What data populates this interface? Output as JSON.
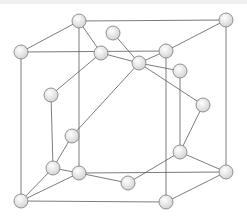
{
  "diagram": {
    "type": "crystal-lattice",
    "colors": {
      "bond": "#5a5a5a",
      "atom_fill_light": "#ffffff",
      "atom_fill_dark": "#d4d4d4",
      "atom_stroke": "#7a7a7a",
      "background": "#ffffff"
    },
    "atom_radius": 7,
    "atoms": [
      {
        "id": "A",
        "x": 79,
        "y": 21
      },
      {
        "id": "B",
        "x": 226,
        "y": 20
      },
      {
        "id": "C",
        "x": 21,
        "y": 52
      },
      {
        "id": "D",
        "x": 166,
        "y": 51
      },
      {
        "id": "E",
        "x": 113,
        "y": 33
      },
      {
        "id": "F",
        "x": 101,
        "y": 53
      },
      {
        "id": "G",
        "x": 139,
        "y": 63
      },
      {
        "id": "H",
        "x": 180,
        "y": 71
      },
      {
        "id": "I",
        "x": 203,
        "y": 105
      },
      {
        "id": "J",
        "x": 51,
        "y": 95
      },
      {
        "id": "K",
        "x": 72,
        "y": 136
      },
      {
        "id": "L",
        "x": 53,
        "y": 168
      },
      {
        "id": "M",
        "x": 79,
        "y": 173
      },
      {
        "id": "N",
        "x": 128,
        "y": 183
      },
      {
        "id": "O",
        "x": 180,
        "y": 152
      },
      {
        "id": "P",
        "x": 226,
        "y": 172
      },
      {
        "id": "Q",
        "x": 21,
        "y": 201
      },
      {
        "id": "R",
        "x": 166,
        "y": 202
      }
    ],
    "bonds": [
      [
        "A",
        "B"
      ],
      [
        "A",
        "C"
      ],
      [
        "C",
        "D"
      ],
      [
        "B",
        "D"
      ],
      [
        "A",
        "F"
      ],
      [
        "A",
        "M"
      ],
      [
        "C",
        "Q"
      ],
      [
        "D",
        "R"
      ],
      [
        "B",
        "P"
      ],
      [
        "E",
        "G"
      ],
      [
        "F",
        "G"
      ],
      [
        "F",
        "J"
      ],
      [
        "G",
        "D"
      ],
      [
        "G",
        "I"
      ],
      [
        "G",
        "K"
      ],
      [
        "H",
        "O"
      ],
      [
        "J",
        "L"
      ],
      [
        "K",
        "L"
      ],
      [
        "I",
        "O"
      ],
      [
        "O",
        "N"
      ],
      [
        "O",
        "P"
      ],
      [
        "L",
        "M"
      ],
      [
        "M",
        "N"
      ],
      [
        "M",
        "P"
      ],
      [
        "L",
        "Q"
      ],
      [
        "M",
        "Q"
      ],
      [
        "Q",
        "R"
      ],
      [
        "R",
        "P"
      ],
      [
        "H",
        "G"
      ]
    ]
  }
}
